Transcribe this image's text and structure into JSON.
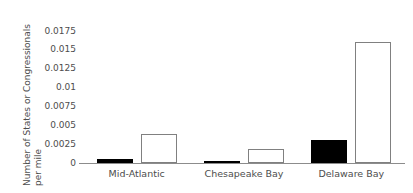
{
  "chart_data": {
    "type": "bar",
    "title": "",
    "xlabel": "",
    "ylabel": "Number of States or Congressionals per mile",
    "ylabel_line1": "Number of States or Congressionals",
    "ylabel_line2": "per mile",
    "categories": [
      "Mid-Atlantic",
      "Chesapeake Bay",
      "Delaware Bay"
    ],
    "series": [
      {
        "name": "states",
        "style": "filled-black",
        "color": "#000000",
        "values": [
          0.0005,
          0.0003,
          0.003
        ]
      },
      {
        "name": "congressionals",
        "style": "open-white",
        "color": "#ffffff",
        "edge_color": "#808080",
        "values": [
          0.0038,
          0.0018,
          0.016
        ]
      }
    ],
    "ylim": [
      0,
      0.0175
    ],
    "yticks": [
      0,
      0.0025,
      0.005,
      0.0075,
      0.01,
      0.0125,
      0.015,
      0.0175
    ],
    "ytick_labels": [
      "0",
      "0.0025",
      "0.005",
      "0.0075",
      "0.01",
      "0.0125",
      "0.015",
      "0.0175"
    ],
    "grid": false,
    "legend": false,
    "legend_position": "none",
    "axis_color": "#8c8c8c",
    "text_color": "#4d4d4d",
    "background": "#ffffff"
  }
}
